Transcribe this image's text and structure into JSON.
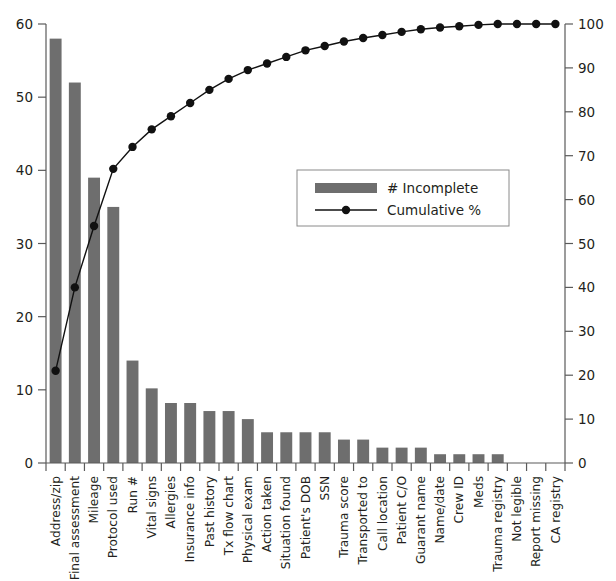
{
  "chart_data": {
    "type": "bar",
    "title": "",
    "subtitle": "",
    "xlabel": "",
    "ylabel": "",
    "y2label": "",
    "grid": false,
    "legend_position": "center-right",
    "categories": [
      "Address/zip",
      "Final assessment",
      "Mileage",
      "Protocol used",
      "Run #",
      "Vital signs",
      "Allergies",
      "Insurance info",
      "Past history",
      "Tx flow chart",
      "Physical exam",
      "Action taken",
      "Situation found",
      "Patient's DOB",
      "SSN",
      "Trauma score",
      "Transported to",
      "Call location",
      "Patient C/O",
      "Guarant name",
      "Name/date",
      "Crew ID",
      "Meds",
      "Trauma registry",
      "Not legible",
      "Report missing",
      "CA registry"
    ],
    "series": [
      {
        "name": "# Incomplete",
        "type": "bar",
        "axis": "left",
        "color": "#6e6e6e",
        "values": [
          58,
          52,
          39,
          35,
          14,
          10.2,
          8.2,
          8.2,
          7.1,
          7.1,
          6,
          4.2,
          4.2,
          4.2,
          4.2,
          3.2,
          3.2,
          2.1,
          2.1,
          2.1,
          1.2,
          1.2,
          1.2,
          1.2,
          0,
          0,
          0
        ]
      },
      {
        "name": "Cumulative %",
        "type": "line",
        "axis": "right",
        "color": "#111111",
        "values": [
          21,
          40,
          54,
          67,
          72,
          76,
          79,
          82,
          85,
          87.5,
          89.5,
          91,
          92.5,
          94,
          95,
          96,
          96.8,
          97.5,
          98.2,
          98.8,
          99.2,
          99.5,
          99.8,
          100,
          100,
          100,
          100
        ]
      }
    ],
    "y_left": {
      "ticks": [
        0,
        10,
        20,
        30,
        40,
        50,
        60
      ],
      "labels": [
        "0",
        "10",
        "20",
        "30",
        "40",
        "50",
        "60"
      ],
      "ylim": [
        0,
        60
      ]
    },
    "y_right": {
      "ticks": [
        0,
        10,
        20,
        30,
        40,
        50,
        60,
        70,
        80,
        90,
        100
      ],
      "labels": [
        "0",
        "10",
        "20",
        "30",
        "40",
        "50",
        "60",
        "70",
        "80",
        "90",
        "100"
      ],
      "ylim": [
        0,
        100
      ]
    },
    "legend": [
      {
        "label": "# Incomplete",
        "marker": "bar-swatch",
        "color": "#6e6e6e"
      },
      {
        "label": "Cumulative %",
        "marker": "line-dot",
        "color": "#111111"
      }
    ]
  },
  "colors": {
    "bar": "#6e6e6e",
    "line": "#111111",
    "axis": "#5a5a5a",
    "text": "#231f20",
    "background": "#ffffff",
    "legend_border": "#8a8a8a"
  }
}
